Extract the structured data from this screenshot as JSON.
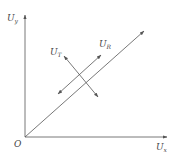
{
  "diagram": {
    "type": "vector-diagram",
    "origin_label": "O",
    "axes": {
      "x": {
        "symbol": "U",
        "subscript": "x"
      },
      "y": {
        "symbol": "U",
        "subscript": "y"
      }
    },
    "vectors": [
      {
        "id": "diagonal",
        "label": "",
        "style": "single-arrow",
        "from": [
          25,
          137
        ],
        "to": [
          144,
          31
        ]
      },
      {
        "id": "U_R",
        "symbol": "U",
        "subscript": "R",
        "style": "double-arrow",
        "from": [
          58,
          94
        ],
        "to": [
          101,
          55
        ]
      },
      {
        "id": "U_T",
        "symbol": "U",
        "subscript": "T",
        "style": "double-arrow",
        "from": [
          64,
          56
        ],
        "to": [
          98,
          97
        ]
      }
    ],
    "colors": {
      "line": "#555555",
      "text": "#444444",
      "background": "#ffffff"
    }
  }
}
